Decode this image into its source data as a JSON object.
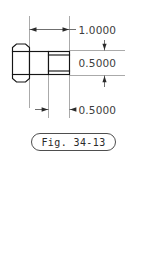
{
  "figure": {
    "caption": "Fig. 34-13",
    "background_color": "#ffffff",
    "object_line_color": "#151515",
    "dimension_line_color": "#4a4a4a",
    "extension_line_color": "#8e8e8e",
    "text_color": "#3d3d3d"
  },
  "dimensions": [
    {
      "id": "overall-length",
      "value": "1.0000",
      "orientation": "horizontal",
      "position": "top",
      "arrows": "both-inward"
    },
    {
      "id": "shank-diameter",
      "value": "0.5000",
      "orientation": "vertical",
      "position": "right",
      "arrows": "both-outward"
    },
    {
      "id": "thread-length",
      "value": "0.5000",
      "orientation": "horizontal",
      "position": "bottom",
      "arrows": "both-outward"
    }
  ],
  "parts": [
    {
      "id": "hex-head",
      "label": "hex-head"
    },
    {
      "id": "shank",
      "label": "shank"
    },
    {
      "id": "threaded-section",
      "label": "threaded-section"
    }
  ]
}
